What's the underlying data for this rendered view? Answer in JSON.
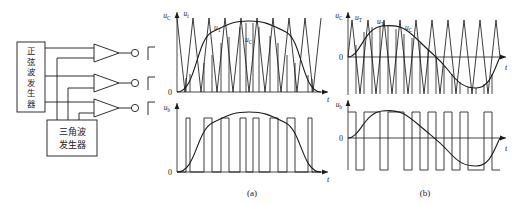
{
  "figure": {
    "stroke_color": "#1a1a1a",
    "background_color": "#ffffff"
  },
  "block_diagram": {
    "sine_generator_label": "正弦波发生器",
    "triangle_generator_label_line1": "三角波",
    "triangle_generator_label_line2": "发生器",
    "comparator_count": 3,
    "output_symbol": "square-wave",
    "output_node_symbol": "open-circle"
  },
  "captions": {
    "a": "(a)",
    "b": "(b)"
  },
  "chart_a": {
    "panel_top": {
      "axis_y_label": "u_C",
      "axis_y_label_2": "u_t",
      "axis_x_label": "t",
      "origin_label": "0",
      "curve_labels": [
        "u_T",
        "u_C"
      ]
    },
    "panel_bottom": {
      "axis_y_label": "u_b",
      "axis_x_label": "t",
      "origin_label": "0"
    }
  },
  "chart_b": {
    "panel_top": {
      "axis_y_label": "u_C",
      "axis_x_label": "t",
      "origin_label": "0",
      "curve_labels": [
        "u_T",
        "u_T",
        "u_C"
      ]
    },
    "panel_bottom": {
      "axis_y_label": "u_b",
      "axis_x_label": "t",
      "origin_label": "0"
    }
  },
  "chart_data": [
    {
      "type": "line",
      "id": "a-top",
      "title": "(a) unipolar SPWM - carrier and modulating wave",
      "xlabel": "t",
      "ylabel": "u_C , u_t",
      "grid": false,
      "legend": [
        "u_T (triangular carrier)",
        "u_C (sine modulating wave)"
      ],
      "ylim": [
        0,
        1
      ],
      "xlim": [
        0,
        1
      ],
      "series": [
        {
          "name": "u_T",
          "waveform": "triangular",
          "polarity": "unipolar",
          "cycles": 9,
          "amplitude": 1.0,
          "baseline": 0
        },
        {
          "name": "u_C",
          "waveform": "half-sine",
          "polarity": "unipolar",
          "cycles": 0.5,
          "amplitude": 0.72,
          "baseline": 0
        }
      ]
    },
    {
      "type": "line",
      "id": "a-bottom",
      "title": "(a) unipolar SPWM - output pulse train u_b",
      "xlabel": "t",
      "ylabel": "u_b",
      "grid": false,
      "ylim": [
        0,
        1
      ],
      "xlim": [
        0,
        1
      ],
      "series": [
        {
          "name": "u_b",
          "waveform": "pwm-pulse-train",
          "polarity": "unipolar",
          "pulse_count": 9,
          "duty_envelope": "half-sine",
          "amplitude": 1.0
        },
        {
          "name": "envelope",
          "waveform": "half-sine",
          "amplitude": 0.78,
          "cycles": 0.5
        }
      ]
    },
    {
      "type": "line",
      "id": "b-top",
      "title": "(b) bipolar SPWM - carrier and modulating wave",
      "xlabel": "t",
      "ylabel": "u_C",
      "grid": false,
      "legend": [
        "u_T (triangular carrier)",
        "u_C (sine modulating wave)"
      ],
      "ylim": [
        -1,
        1
      ],
      "xlim": [
        0,
        1
      ],
      "series": [
        {
          "name": "u_T",
          "waveform": "triangular",
          "polarity": "bipolar",
          "cycles": 9,
          "amplitude": 1.0,
          "baseline": 0
        },
        {
          "name": "u_C",
          "waveform": "sine",
          "polarity": "bipolar",
          "cycles": 1,
          "amplitude": 0.62,
          "baseline": 0
        }
      ]
    },
    {
      "type": "line",
      "id": "b-bottom",
      "title": "(b) bipolar SPWM - output pulse train u_b",
      "xlabel": "t",
      "ylabel": "u_b",
      "grid": false,
      "ylim": [
        -1,
        1
      ],
      "xlim": [
        0,
        1
      ],
      "series": [
        {
          "name": "u_b",
          "waveform": "pwm-pulse-train",
          "polarity": "bipolar",
          "pulse_count": 9,
          "duty_envelope": "sine",
          "amplitude": 1.0
        },
        {
          "name": "envelope",
          "waveform": "sine",
          "amplitude": 0.62,
          "cycles": 1
        }
      ]
    }
  ]
}
